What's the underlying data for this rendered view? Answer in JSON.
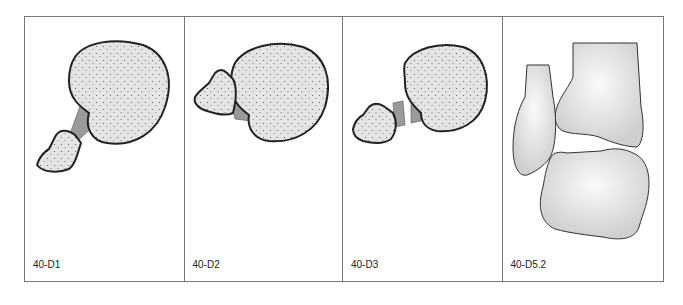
{
  "figure": {
    "panels": [
      {
        "id": "D1",
        "label": "40-D1",
        "description": "Avulsion fragment attached by long intact ligament"
      },
      {
        "id": "D2",
        "label": "40-D2",
        "description": "Fragment displaced close to bone with short ligament"
      },
      {
        "id": "D3",
        "label": "40-D3",
        "description": "Ligament ruptured between fragment and bone"
      },
      {
        "id": "D5.2",
        "label": "40-D5.2",
        "description": "Ankle joint: tibia, fibula and talus"
      }
    ],
    "colors": {
      "border": "#777777",
      "bone_fill": "#e6e6e6",
      "outline": "#222222",
      "stipple": "#555555"
    }
  }
}
